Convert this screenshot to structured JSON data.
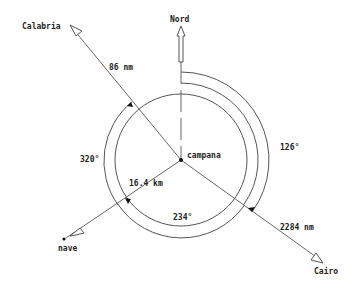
{
  "labels": {
    "north": "Nord",
    "calabria": "Calabria",
    "cairo": "Cairo",
    "nave": "nave",
    "campana": "campana",
    "dist_calabria": "86 nm",
    "dist_cairo": "2284 nm",
    "dist_nave": "16.4 km",
    "angle_calabria": "320°",
    "angle_cairo": "126°",
    "angle_nave": "234°"
  },
  "colors": {
    "line": "#666666",
    "text": "#222222",
    "background": "#ffffff"
  }
}
